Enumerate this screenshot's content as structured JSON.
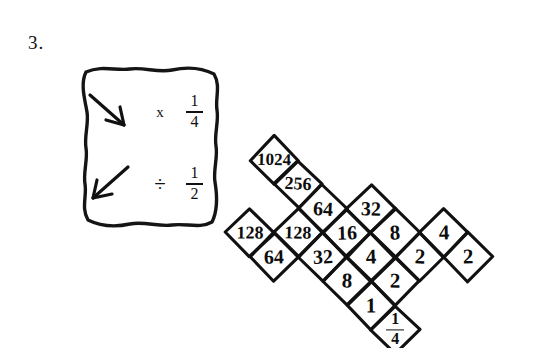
{
  "worksheet": {
    "problem_number": "3.",
    "background_color": "#ffffff",
    "ink_color": "#111111"
  },
  "legend": {
    "name": "rule-key-box",
    "rows": [
      {
        "arrow_icon": "arrow-down-right-icon",
        "arrow_direction": "down-right",
        "operator": "x",
        "operator_name": "multiply",
        "value": "1/4",
        "numerator": "1",
        "denominator": "4"
      },
      {
        "arrow_icon": "arrow-down-left-icon",
        "arrow_direction": "down-left",
        "operator": "÷",
        "operator_name": "divide",
        "value": "1/2",
        "numerator": "1",
        "denominator": "2"
      }
    ]
  },
  "lattice": {
    "name": "diamond-number-lattice",
    "shape": "x-cross",
    "step_px": 48.5,
    "cells": [
      {
        "id": "c-1024",
        "row": 0,
        "col": 0,
        "text": "1024",
        "size": "v4"
      },
      {
        "id": "c-256",
        "row": 0,
        "col": 1,
        "text": "256",
        "size": "v3"
      },
      {
        "id": "c-64a",
        "row": 0,
        "col": 2,
        "text": "64",
        "size": "v2"
      },
      {
        "id": "c-16",
        "row": 0,
        "col": 3,
        "text": "16",
        "size": "v2"
      },
      {
        "id": "c-32a",
        "row": -1,
        "col": 3,
        "text": "32",
        "size": "v2"
      },
      {
        "id": "c-8a",
        "row": -1,
        "col": 4,
        "text": "8",
        "size": "v1"
      },
      {
        "id": "c-2a",
        "row": -1,
        "col": 5,
        "text": "2",
        "size": "v1"
      },
      {
        "id": "c-4a",
        "row": -2,
        "col": 5,
        "text": "4",
        "size": "v1"
      },
      {
        "id": "c-2b",
        "row": -2,
        "col": 6,
        "text": "2",
        "size": "v1"
      },
      {
        "id": "c-128a",
        "row": 1,
        "col": 2,
        "text": "128",
        "size": "v3"
      },
      {
        "id": "c-32b",
        "row": 1,
        "col": 3,
        "text": "32",
        "size": "v2"
      },
      {
        "id": "c-8b",
        "row": 1,
        "col": 4,
        "text": "8",
        "size": "v1"
      },
      {
        "id": "c-64b",
        "row": 2,
        "col": 2,
        "text": "64",
        "size": "v2"
      },
      {
        "id": "c-4b",
        "row": 0,
        "col": 4,
        "text": "4",
        "size": "v1"
      },
      {
        "id": "c-2c",
        "row": 0,
        "col": 5,
        "text": "2",
        "size": "v1"
      },
      {
        "id": "c-1",
        "row": 1,
        "col": 5,
        "text": "1",
        "size": "v1"
      },
      {
        "id": "c-128b",
        "row": 2,
        "col": 1,
        "text": "128",
        "size": "v3"
      }
    ],
    "fraction_cells": [
      {
        "id": "c-quarter",
        "row": 1,
        "col": 6,
        "numerator": "1",
        "denominator": "4"
      }
    ]
  }
}
